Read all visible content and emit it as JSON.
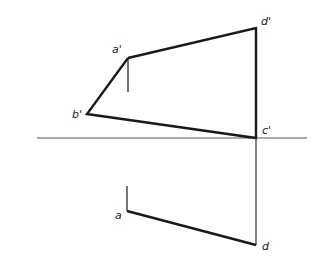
{
  "diagram": {
    "type": "orthographic projection (descriptive geometry)",
    "colors": {
      "line": "#1a1a1a",
      "axis": "#555555",
      "background": "#ffffff"
    },
    "axis": {
      "x1": 37,
      "y": 138,
      "x2": 307
    },
    "points": {
      "a_prime": {
        "label": "a'",
        "x": 128,
        "y": 58,
        "label_x": 112,
        "label_y": 53
      },
      "b_prime": {
        "label": "b'",
        "x": 87,
        "y": 114,
        "label_x": 72,
        "label_y": 118
      },
      "c_prime": {
        "label": "c'",
        "x": 256,
        "y": 138,
        "label_x": 262,
        "label_y": 134
      },
      "d_prime": {
        "label": "d'",
        "x": 256,
        "y": 28,
        "label_x": 261,
        "label_y": 25
      },
      "a": {
        "label": "a",
        "x": 127,
        "y": 211,
        "label_x": 115,
        "label_y": 219
      },
      "d": {
        "label": "d",
        "x": 256,
        "y": 245,
        "label_x": 262,
        "label_y": 250
      }
    },
    "labels": [
      "a'",
      "b'",
      "c'",
      "d'",
      "a",
      "d"
    ]
  }
}
